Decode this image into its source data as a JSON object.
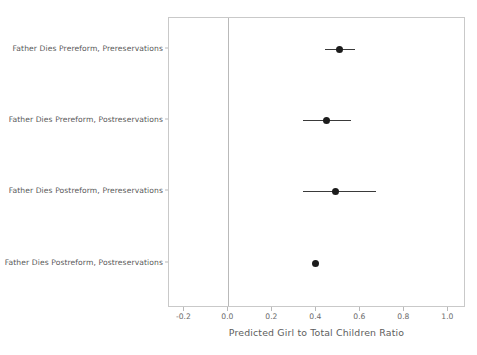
{
  "chart_data": {
    "type": "scatter",
    "subtype": "coefficient-dot-plot-with-confidence-intervals",
    "title": "",
    "xlabel": "Predicted Girl to Total Children Ratio",
    "ylabel": "",
    "xlim": [
      -0.27,
      1.08
    ],
    "ylim": [
      0,
      4
    ],
    "grid": false,
    "legend": null,
    "reference_line": {
      "x": 0.0,
      "color": "#b9b9b9",
      "orientation": "vertical"
    },
    "xticks": [
      -0.2,
      0.0,
      0.2,
      0.4,
      0.6,
      0.8,
      1.0
    ],
    "xticklabels": [
      "-0.2",
      "0.0",
      "0.2",
      "0.4",
      "0.6",
      "0.8",
      "1.0"
    ],
    "categories": [
      "Father Dies Prereform, Prereservations",
      "Father Dies Prereform, Postreservations",
      "Father Dies Postreform, Prereservations",
      "Father Dies Postreform, Postreservations"
    ],
    "points": [
      {
        "label": "Father Dies Prereform, Prereservations",
        "estimate": 0.505,
        "ci_low": 0.44,
        "ci_high": 0.575
      },
      {
        "label": "Father Dies Prereform, Postreservations",
        "estimate": 0.446,
        "ci_low": 0.338,
        "ci_high": 0.558
      },
      {
        "label": "Father Dies Postreform, Prereservations",
        "estimate": 0.488,
        "ci_low": 0.338,
        "ci_high": 0.671
      },
      {
        "label": "Father Dies Postreform, Postreservations",
        "estimate": 0.396,
        "ci_low": 0.396,
        "ci_high": 0.396
      }
    ],
    "colors": {
      "point": "#1c1c1c",
      "errorbar": "#3a3a3a",
      "frame": "#c9c9c9",
      "reference_line": "#b9b9b9",
      "text": "#595959",
      "background": "#ffffff"
    }
  }
}
